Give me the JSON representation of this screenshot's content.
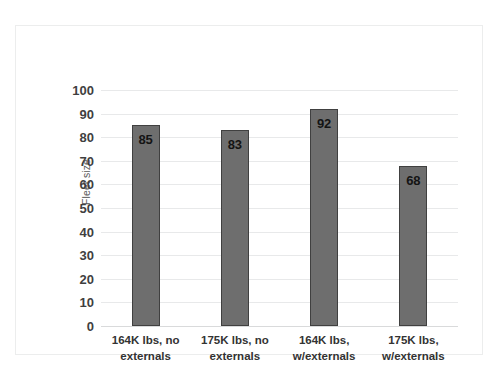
{
  "chart_data": {
    "type": "bar",
    "title": "",
    "xlabel": "",
    "ylabel": "Fleet size",
    "categories": [
      "164K lbs, no externals",
      "175K lbs, no externals",
      "164K lbs, w/externals",
      "175K lbs, w/externals"
    ],
    "values": [
      85,
      83,
      92,
      68
    ],
    "data_labels": [
      "85",
      "83",
      "92",
      "68"
    ],
    "ylim": [
      0,
      100
    ],
    "ytick_step": 10,
    "yticks": [
      "100",
      "90",
      "80",
      "70",
      "60",
      "50",
      "40",
      "30",
      "20",
      "10",
      "0"
    ],
    "grid": true,
    "legend": false,
    "colors": {
      "bar_fill": "#6e6e6e",
      "bar_border": "#404040",
      "gridline": "#e8e9ea",
      "label_text": "#141414",
      "tick_text": "#3f3f3f",
      "axis_title": "#595959",
      "frame_border": "#eceded",
      "background": "#ffffff"
    }
  }
}
